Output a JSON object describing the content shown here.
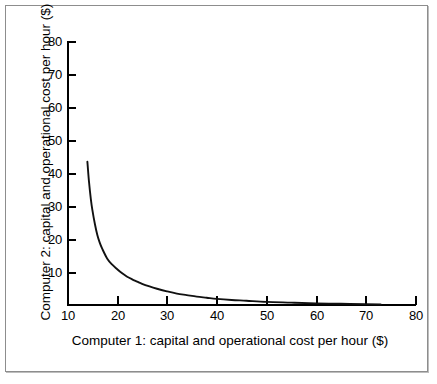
{
  "figure": {
    "background_color": "#ffffff",
    "frame_color": "#8d8d8d",
    "curve_color": "#111111"
  },
  "chart_data": {
    "type": "line",
    "title": "",
    "subtitle": "",
    "xlabel": "Computer 1: capital and operational cost per hour ($)",
    "ylabel": "Computer 2: capital and operational cost per hour ($)",
    "xlim": [
      10,
      80
    ],
    "ylim": [
      10,
      80
    ],
    "xticks": [
      10,
      20,
      30,
      40,
      50,
      60,
      70,
      80
    ],
    "yticks": [
      10,
      20,
      30,
      40,
      50,
      60,
      70,
      80
    ],
    "xtick_labels": [
      "10",
      "20",
      "30",
      "40",
      "50",
      "60",
      "70",
      "80"
    ],
    "ytick_labels": [
      "10",
      "20",
      "30",
      "40",
      "50",
      "60",
      "70",
      "80"
    ],
    "grid": false,
    "legend": null,
    "legend_position": "none",
    "annotations": [],
    "series": [
      {
        "name": "cost trade-off curve",
        "color": "#111111",
        "x": [
          14.0,
          14.3,
          14.7,
          15.0,
          15.5,
          16.0,
          16.5,
          17.0,
          18.0,
          19.0,
          20.0,
          21.0,
          22.0,
          23.0,
          24.0,
          25.0,
          26.5,
          28.0,
          30.0,
          32.0,
          34.0,
          36.0,
          38.0,
          40.0,
          43.0,
          46.0,
          50.0,
          55.0,
          60.0,
          65.0,
          70.0,
          73.0
        ],
        "y": [
          48.0,
          43.0,
          38.0,
          35.2,
          31.5,
          28.5,
          26.4,
          24.8,
          22.2,
          20.6,
          19.4,
          18.3,
          17.4,
          16.7,
          16.1,
          15.5,
          14.8,
          14.2,
          13.5,
          12.9,
          12.5,
          12.1,
          11.8,
          11.5,
          11.2,
          11.0,
          10.7,
          10.5,
          10.3,
          10.2,
          10.1,
          10.0
        ]
      }
    ]
  },
  "axis": {
    "y_title": "Computer 2: capital and operational cost per hour ($)",
    "x_title": "Computer 1: capital and operational cost per hour ($)"
  }
}
